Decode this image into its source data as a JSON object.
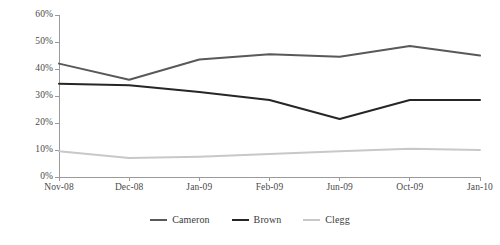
{
  "chart_data": {
    "type": "line",
    "title": "",
    "xlabel": "",
    "ylabel": "",
    "categories": [
      "Nov-08",
      "Dec-08",
      "Jan-09",
      "Feb-09",
      "Jun-09",
      "Oct-09",
      "Jan-10"
    ],
    "ylim": [
      0,
      60
    ],
    "yticks": [
      0,
      10,
      20,
      30,
      40,
      50,
      60
    ],
    "ytick_labels": [
      "0%",
      "10%",
      "20%",
      "30%",
      "40%",
      "50%",
      "60%"
    ],
    "grid": false,
    "legend_position": "bottom",
    "series": [
      {
        "name": "Cameron",
        "color": "#595959",
        "values": [
          42.0,
          36.0,
          43.5,
          45.5,
          44.5,
          48.5,
          45.0
        ]
      },
      {
        "name": "Brown",
        "color": "#262626",
        "values": [
          34.5,
          34.0,
          31.5,
          28.5,
          21.5,
          28.5,
          28.5
        ]
      },
      {
        "name": "Clegg",
        "color": "#c8c8c8",
        "values": [
          9.5,
          7.0,
          7.5,
          8.5,
          9.5,
          10.5,
          10.0
        ]
      }
    ]
  },
  "axis": {
    "line_color": "#9a9a9a",
    "tick_color": "#9a9a9a"
  }
}
